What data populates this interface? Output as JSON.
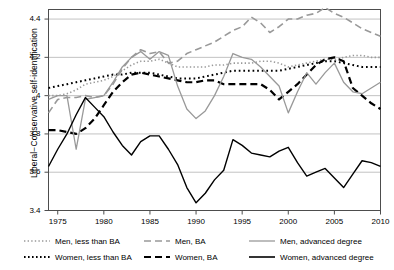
{
  "chart_data": {
    "type": "line",
    "title": "",
    "xlabel": "",
    "ylabel": "Liberal−Conservative self-identification",
    "xlim": [
      1974,
      2010
    ],
    "ylim": [
      3.4,
      4.45
    ],
    "grid": true,
    "legend_position": "below",
    "xticks": [
      1975,
      1980,
      1985,
      1990,
      1995,
      2000,
      2005,
      2010
    ],
    "yticks": [
      "3.4",
      "3.6",
      "3.8",
      "4",
      "4.2",
      "4.4"
    ],
    "x": [
      1974,
      1975,
      1976,
      1977,
      1978,
      1979,
      1980,
      1981,
      1982,
      1983,
      1984,
      1985,
      1986,
      1987,
      1988,
      1989,
      1990,
      1991,
      1992,
      1993,
      1994,
      1995,
      1996,
      1997,
      1998,
      1999,
      2000,
      2001,
      2002,
      2003,
      2004,
      2005,
      2006,
      2007,
      2008,
      2009,
      2010
    ],
    "series": [
      {
        "name": "Men, less than BA",
        "color": "#999999",
        "style": "dotted",
        "width": 1.6,
        "values": [
          4.0,
          4.0,
          4.01,
          4.03,
          4.06,
          4.07,
          4.08,
          4.1,
          4.13,
          4.16,
          4.18,
          4.18,
          4.19,
          4.17,
          4.15,
          4.15,
          4.15,
          4.15,
          4.16,
          4.16,
          4.17,
          4.17,
          4.17,
          4.18,
          4.18,
          4.17,
          4.15,
          4.16,
          4.17,
          4.18,
          4.19,
          4.19,
          4.2,
          4.21,
          4.21,
          4.2,
          4.2
        ]
      },
      {
        "name": "Women, less than BA",
        "color": "#000000",
        "style": "dotted",
        "width": 2.0,
        "values": [
          4.04,
          4.05,
          4.06,
          4.07,
          4.08,
          4.09,
          4.1,
          4.11,
          4.11,
          4.12,
          4.12,
          4.12,
          4.11,
          4.1,
          4.09,
          4.09,
          4.09,
          4.1,
          4.11,
          4.12,
          4.13,
          4.13,
          4.13,
          4.13,
          4.13,
          4.13,
          4.14,
          4.15,
          4.16,
          4.17,
          4.18,
          4.18,
          4.17,
          4.16,
          4.15,
          4.15,
          4.15
        ]
      },
      {
        "name": "Men, BA",
        "color": "#999999",
        "style": "dashed",
        "width": 1.6,
        "values": [
          3.91,
          3.98,
          3.99,
          3.99,
          4.0,
          3.99,
          4.0,
          4.06,
          4.14,
          4.2,
          4.24,
          4.22,
          4.23,
          4.17,
          4.18,
          4.22,
          4.24,
          4.26,
          4.28,
          4.31,
          4.34,
          4.36,
          4.41,
          4.38,
          4.33,
          4.36,
          4.4,
          4.4,
          4.42,
          4.43,
          4.46,
          4.43,
          4.41,
          4.38,
          4.35,
          4.33,
          4.31
        ]
      },
      {
        "name": "Women, BA",
        "color": "#000000",
        "style": "dashed",
        "width": 2.2,
        "values": [
          3.82,
          3.82,
          3.81,
          3.8,
          3.83,
          3.88,
          3.95,
          4.02,
          4.07,
          4.11,
          4.12,
          4.11,
          4.1,
          4.09,
          4.08,
          4.07,
          4.07,
          4.08,
          4.08,
          4.06,
          4.06,
          4.06,
          4.06,
          4.06,
          4.03,
          3.98,
          4.02,
          4.06,
          4.11,
          4.16,
          4.19,
          4.2,
          4.18,
          4.04,
          4.0,
          3.96,
          3.93
        ]
      },
      {
        "name": "Men, advanced degree",
        "color": "#999999",
        "style": "solid",
        "width": 1.3,
        "values": [
          3.98,
          4.0,
          4.0,
          3.72,
          3.98,
          3.99,
          4.0,
          4.07,
          4.15,
          4.2,
          4.23,
          4.19,
          4.23,
          4.21,
          4.05,
          3.93,
          3.88,
          3.92,
          4.0,
          4.1,
          4.22,
          4.2,
          4.19,
          4.15,
          4.1,
          4.05,
          3.91,
          4.02,
          4.12,
          4.06,
          4.12,
          4.17,
          4.07,
          4.02,
          4.01,
          4.04,
          4.07
        ]
      },
      {
        "name": "Women, advanced degree",
        "color": "#000000",
        "style": "solid",
        "width": 1.4,
        "values": [
          3.63,
          3.72,
          3.8,
          3.9,
          3.99,
          3.94,
          3.89,
          3.81,
          3.74,
          3.69,
          3.76,
          3.79,
          3.79,
          3.72,
          3.64,
          3.52,
          3.44,
          3.49,
          3.56,
          3.61,
          3.77,
          3.74,
          3.7,
          3.69,
          3.68,
          3.71,
          3.73,
          3.65,
          3.58,
          3.6,
          3.62,
          3.57,
          3.52,
          3.59,
          3.66,
          3.65,
          3.63
        ]
      }
    ]
  },
  "legend": {
    "items": [
      {
        "label": "Men, less than BA"
      },
      {
        "label": "Men, BA"
      },
      {
        "label": "Men, advanced degree"
      },
      {
        "label": "Women, less than BA"
      },
      {
        "label": "Women, BA"
      },
      {
        "label": "Women, advanced degree"
      }
    ]
  }
}
